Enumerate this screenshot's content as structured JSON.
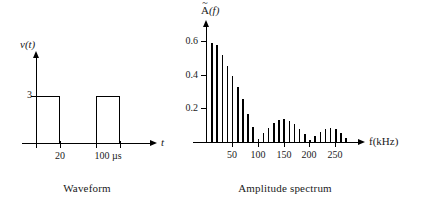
{
  "figure": {
    "background": "#ffffff",
    "ink_color": "#000000"
  },
  "waveform": {
    "caption": "Waveform",
    "y_axis_label_prefix": "v",
    "y_axis_label": "v(t)",
    "x_axis_label": "t",
    "y_tick_labels": [
      "3"
    ],
    "x_tick_labels": [
      "20",
      "100 µs"
    ],
    "amplitude": 3,
    "pulse_width_us": 20,
    "period_us": 100,
    "pulses": [
      {
        "start_us": 0,
        "end_us": 20,
        "height": 3
      },
      {
        "start_us": 100,
        "end_us": 120,
        "height": 3
      }
    ]
  },
  "spectrum": {
    "caption": "Amplitude spectrum",
    "y_axis_label": "A(f)",
    "y_axis_label_base": "A",
    "y_axis_label_accent": "~",
    "y_axis_label_arg": "(f)",
    "x_axis_label": "f(kHz)",
    "y_tick_labels": [
      "0.2",
      "0.4",
      "0.6"
    ],
    "x_tick_labels": [
      "50",
      "100",
      "150",
      "200",
      "250"
    ]
  },
  "chart_data": [
    {
      "type": "line",
      "title": "Waveform",
      "xlabel": "t",
      "ylabel": "v(t)",
      "xlim": [
        -10,
        190
      ],
      "ylim": [
        0,
        4.2
      ],
      "xticks": [
        20,
        100
      ],
      "xticklabels": [
        "20",
        "100 µs"
      ],
      "yticks": [
        3
      ],
      "yticklabels": [
        "3"
      ],
      "grid": false,
      "legend": null,
      "x": [
        0,
        0,
        20,
        20,
        100,
        100,
        120,
        120,
        185
      ],
      "y": [
        0,
        3,
        3,
        0,
        0,
        3,
        3,
        0,
        0
      ],
      "annotations": [
        "Rectangular pulse train, amplitude 3, width 20 µs, period 100 µs"
      ]
    },
    {
      "type": "bar",
      "title": "Amplitude spectrum",
      "xlabel": "f(kHz)",
      "ylabel": "A(f)",
      "xlim": [
        0,
        285
      ],
      "ylim": [
        0,
        0.68
      ],
      "xticks": [
        50,
        100,
        150,
        200,
        250
      ],
      "xticklabels": [
        "50",
        "100",
        "150",
        "200",
        "250"
      ],
      "yticks": [
        0.2,
        0.4,
        0.6
      ],
      "yticklabels": [
        "0.2",
        "0.4",
        "0.6"
      ],
      "grid": false,
      "legend": null,
      "categories": [
        10,
        20,
        30,
        40,
        50,
        60,
        70,
        80,
        90,
        100,
        110,
        120,
        130,
        140,
        150,
        160,
        170,
        180,
        190,
        200,
        210,
        220,
        230,
        240,
        250,
        260,
        270
      ],
      "values": [
        0.59,
        0.575,
        0.52,
        0.455,
        0.39,
        0.325,
        0.255,
        0.165,
        0.09,
        0.015,
        0.055,
        0.085,
        0.115,
        0.13,
        0.135,
        0.125,
        0.105,
        0.08,
        0.045,
        0.012,
        0.038,
        0.062,
        0.078,
        0.082,
        0.075,
        0.055,
        0.025
      ],
      "annotations": [
        "Line spectrum with 10 kHz harmonic spacing; sinc envelope nulls near 50, 100, 150, 200, 250 kHz"
      ]
    }
  ]
}
